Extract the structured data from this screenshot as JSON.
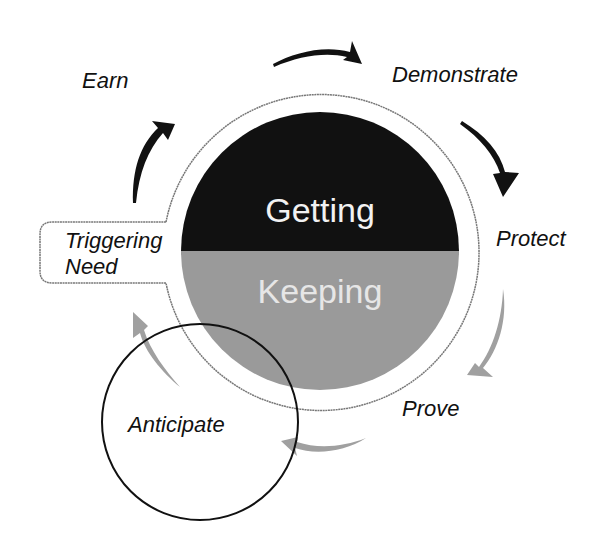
{
  "diagram": {
    "type": "cycle",
    "core": {
      "top_label": "Getting",
      "bottom_label": "Keeping",
      "top_color": "#111111",
      "bottom_color": "#9a9a9a",
      "top_text_color": "#f2f2f2",
      "bottom_text_color": "#e6e6e6"
    },
    "stages": [
      {
        "label": "Earn",
        "phase": "getting"
      },
      {
        "label": "Demonstrate",
        "phase": "getting"
      },
      {
        "label": "Protect",
        "phase": "getting"
      },
      {
        "label": "Prove",
        "phase": "keeping"
      },
      {
        "label": "Anticipate",
        "phase": "keeping",
        "highlighted": true
      }
    ],
    "callout": {
      "line1": "Triggering",
      "line2": "Need"
    },
    "arrow_colors": {
      "getting": "#111111",
      "keeping": "#a0a0a0"
    }
  }
}
